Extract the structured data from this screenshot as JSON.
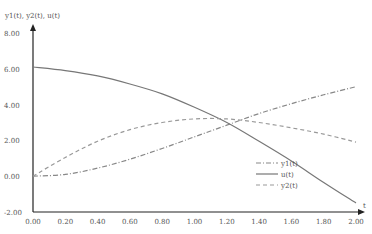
{
  "chart_data": {
    "type": "line",
    "title": "",
    "xlabel": "t",
    "ylabel": "y1(t), y2(t), u(t)",
    "xlim": [
      0,
      2
    ],
    "ylim": [
      -2,
      8
    ],
    "x_ticks": [
      "0.00",
      "0.20",
      "0.40",
      "0.60",
      "0.80",
      "1.00",
      "1.20",
      "1.40",
      "1.60",
      "1.80",
      "2.00"
    ],
    "y_ticks": [
      "-2.00",
      "0.00",
      "2.00",
      "4.00",
      "6.00",
      "8.00"
    ],
    "grid": false,
    "legend_position": "lower right",
    "x": [
      0,
      0.2,
      0.4,
      0.6,
      0.8,
      1.0,
      1.2,
      1.4,
      1.6,
      1.8,
      2.0
    ],
    "series": [
      {
        "name": "y1(t)",
        "style": "dash-dot",
        "color": "#888888",
        "values": [
          0,
          0.1,
          0.45,
          0.95,
          1.55,
          2.2,
          2.85,
          3.5,
          4.05,
          4.55,
          5.0
        ]
      },
      {
        "name": "u(t)",
        "style": "solid",
        "color": "#777777",
        "values": [
          6.1,
          5.9,
          5.6,
          5.15,
          4.6,
          3.85,
          3.0,
          1.95,
          0.85,
          -0.35,
          -1.5
        ]
      },
      {
        "name": "y2(t)",
        "style": "dashed",
        "color": "#999999",
        "values": [
          0,
          1.05,
          1.95,
          2.6,
          3.0,
          3.2,
          3.2,
          3.0,
          2.7,
          2.35,
          1.9
        ]
      }
    ]
  }
}
